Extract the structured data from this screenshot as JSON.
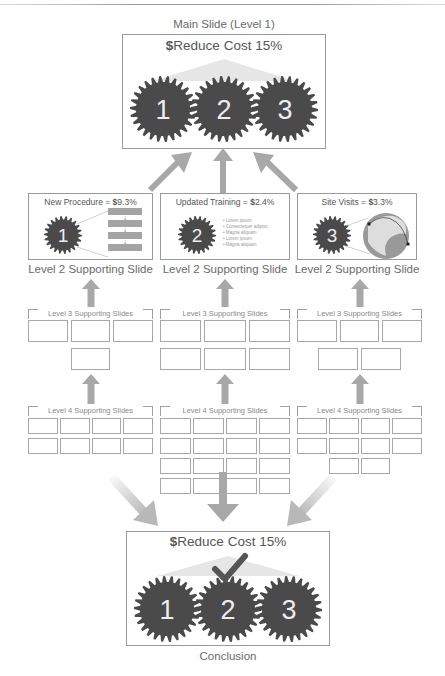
{
  "main_slide": {
    "caption": "Main Slide (Level 1)",
    "title_symbol": "$",
    "title": "Reduce Cost 15%",
    "gears": [
      "1",
      "2",
      "3"
    ]
  },
  "level2": [
    {
      "title": "New Procedure = ",
      "symbol": "$",
      "value": "9.3%",
      "gear": "1",
      "caption": "Level 2 Supporting Slide",
      "visual": "process-flow"
    },
    {
      "title": "Updated Training = ",
      "symbol": "$",
      "value": "2.4%",
      "gear": "2",
      "caption": "Level 2 Supporting Slide",
      "visual": "bullet-list",
      "bullets": [
        "Lorem ipsum",
        "Consectetuer adipisc",
        "Magna aliquam",
        "Lorem ipsum",
        "Magna aliquam"
      ]
    },
    {
      "title": "Site Visits = ",
      "symbol": "$",
      "value": "3.3%",
      "gear": "3",
      "caption": "Level 2 Supporting Slide",
      "visual": "globe"
    }
  ],
  "level3": [
    {
      "label": "Level 3 Supporting Slides",
      "count": 4
    },
    {
      "label": "Level 3 Supporting Slides",
      "count": 6
    },
    {
      "label": "Level 3 Supporting Slides",
      "count": 5
    }
  ],
  "level4": [
    {
      "label": "Level 4 Supporting Slides",
      "count": 8
    },
    {
      "label": "Level 4 Supporting Slides",
      "count": 16
    },
    {
      "label": "Level 4 Supporting Slides",
      "count": 10
    }
  ],
  "conclusion": {
    "title_symbol": "$",
    "title": "Reduce Cost 15%",
    "gears": [
      "1",
      "2",
      "3"
    ],
    "caption": "Conclusion",
    "check_icon": "checkmark-icon"
  },
  "colors": {
    "gear": "#4a4a4a",
    "arrow": "#a8a8a8",
    "border": "#9a9a9a",
    "text": "#666666"
  }
}
